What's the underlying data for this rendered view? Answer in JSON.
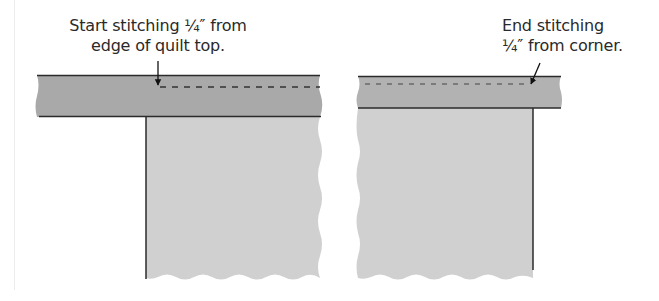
{
  "panels": [
    {
      "id": "start",
      "caption_lines": [
        "Start stitching ¼″ from",
        "edge of quilt top."
      ],
      "arrow": "down"
    },
    {
      "id": "end",
      "caption_lines": [
        "End stitching",
        "¼″ from corner."
      ],
      "arrow": "diagonal"
    }
  ],
  "colors": {
    "binding_strip": "#a9a9a9",
    "quilt_top": "#d0d0d0",
    "outline": "#2b2b2b",
    "stitch": "#333333"
  }
}
